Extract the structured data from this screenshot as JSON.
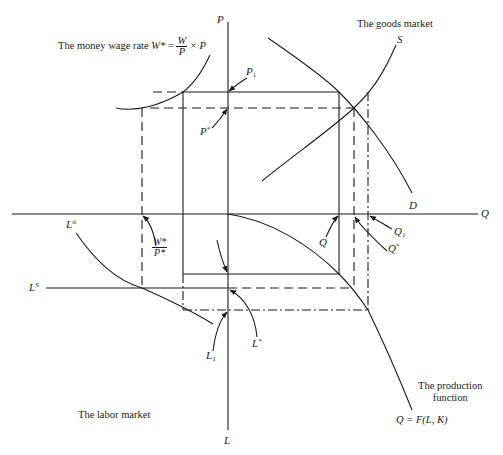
{
  "diagram": {
    "type": "four-quadrant macroeconomic model",
    "quadrants": {
      "top_left": {
        "title": "The money wage rate",
        "equation_lhs": "W*",
        "equation_eq": "=",
        "frac_num": "W",
        "frac_den": "P",
        "equation_tail": "× P"
      },
      "top_right": {
        "title": "The goods market",
        "supply_label": "S",
        "demand_label": "D"
      },
      "bottom_left": {
        "title": "The labor market",
        "demand_label": "L",
        "demand_sup": "d",
        "supply_label": "L",
        "supply_sup": "S"
      },
      "bottom_right": {
        "title_line1": "The production",
        "title_line2": "function",
        "equation": "Q = F(L, K)"
      }
    },
    "axes": {
      "vertical_top": "P",
      "vertical_bottom": "L",
      "horizontal_right": "Q"
    },
    "markers": {
      "P1": {
        "base": "P",
        "sub": "1"
      },
      "Pstar": {
        "base": "P",
        "sup": "*"
      },
      "Q": {
        "base": "Q"
      },
      "Qstar": {
        "base": "Q",
        "sup": "*"
      },
      "Q1": {
        "base": "Q",
        "sub": "1"
      },
      "Lstar": {
        "base": "L",
        "sup": "*"
      },
      "L1": {
        "base": "L",
        "sub": "1"
      },
      "real_wage": {
        "num": "W*",
        "den": "P*"
      }
    },
    "line_styles": {
      "solid": "equilibrium-start path",
      "dashed": "equilibrium path (star values)",
      "dash_dot": "path through subscript-1 values"
    },
    "colors": {
      "ink": "#1a1a1a",
      "background": "#ffffff"
    }
  }
}
